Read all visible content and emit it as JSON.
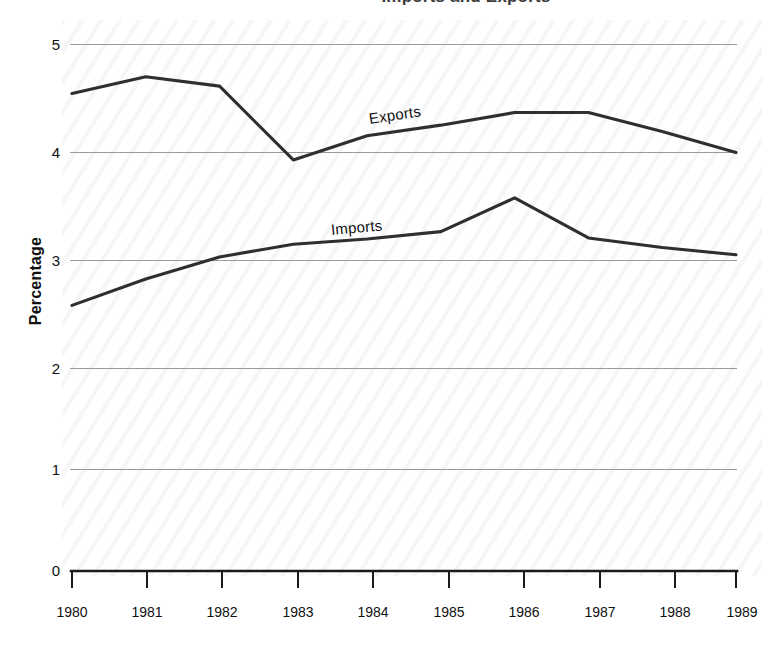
{
  "chart_data": {
    "type": "line",
    "title": "Imports and Exports",
    "title_note": "partially cropped at top edge of image",
    "xlabel": "",
    "ylabel": "Percentage",
    "x": [
      1980,
      1981,
      1982,
      1983,
      1984,
      1985,
      1986,
      1987,
      1988,
      1989
    ],
    "categories": [
      "1980",
      "1981",
      "1982",
      "1983",
      "1984",
      "1985",
      "1986",
      "1987",
      "1988",
      "1989"
    ],
    "series": [
      {
        "name": "Exports",
        "values": [
          4.53,
          4.69,
          4.6,
          3.9,
          4.13,
          4.23,
          4.35,
          4.35,
          4.17,
          3.97
        ],
        "color": "#2f2f2f",
        "label_position": "inline-above-line-1984"
      },
      {
        "name": "Imports",
        "values": [
          2.52,
          2.77,
          2.98,
          3.1,
          3.15,
          3.22,
          3.54,
          3.16,
          3.07,
          3.0
        ],
        "color": "#2f2f2f",
        "label_position": "inline-above-line-1983"
      }
    ],
    "ylim": [
      0,
      5
    ],
    "xlim": [
      1980,
      1989
    ],
    "y_ticks": [
      0,
      1,
      2,
      3,
      4,
      5
    ],
    "y_tick_labels": [
      "0",
      "1",
      "2",
      "3",
      "4",
      "5"
    ],
    "x_ticks": [
      1980,
      1981,
      1982,
      1983,
      1984,
      1985,
      1986,
      1987,
      1988,
      1989
    ],
    "x_tick_labels": [
      "1980",
      "1981",
      "1982",
      "1983",
      "1984",
      "1985",
      "1986",
      "1987",
      "1988",
      "1989"
    ],
    "grid": "horizontal-only",
    "legend": "none-inline-labels",
    "background": "#ffffff",
    "grid_color": "#9a9a9a",
    "axis_color": "#1b1b1b"
  },
  "axis": {
    "y_title": "Percentage"
  }
}
